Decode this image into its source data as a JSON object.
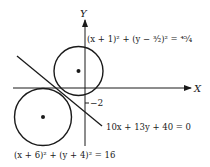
{
  "diagram": {
    "axes": {
      "x_label": "X",
      "y_label": "Y",
      "tick_label": "−2"
    },
    "circles": [
      {
        "name": "upper-circle",
        "equation": "(x + 1)² + (y − ³⁄₂)² = ⁴⁵⁄₄",
        "center": [
          -1,
          1.5
        ],
        "radius_squared": 11.25
      },
      {
        "name": "lower-circle",
        "equation": "(x + 6)² + (y + 4)² = 16",
        "center": [
          -6,
          -4
        ],
        "radius_squared": 16
      }
    ],
    "tangent_line": {
      "equation": "10x + 13y + 40 = 0"
    },
    "colors": {
      "stroke": "#1a1a1a",
      "background": "#ffffff"
    }
  }
}
